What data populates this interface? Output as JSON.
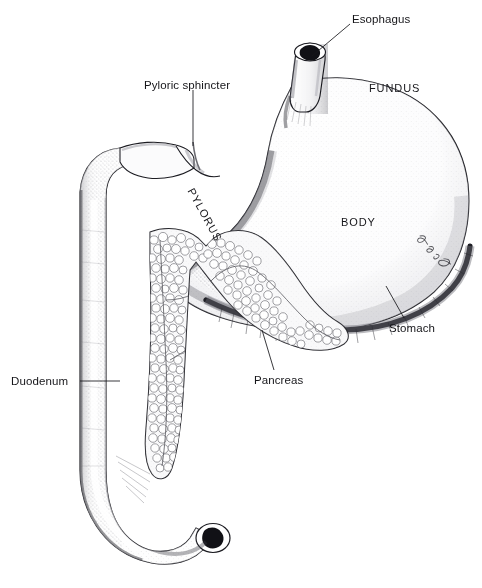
{
  "figure": {
    "style": "pen-and-ink stippled medical illustration",
    "background_color": "#ffffff",
    "ink_color": "#16161a",
    "signature": "Jon E. Crawford"
  },
  "labels": {
    "esophagus": "Esophagus",
    "pyloric_sphincter": "Pyloric sphincter",
    "fundus": "FUNDUS",
    "body": "BODY",
    "pylorus": "PYLORUS",
    "stomach": "Stomach",
    "pancreas": "Pancreas",
    "duodenum": "Duodenum"
  }
}
